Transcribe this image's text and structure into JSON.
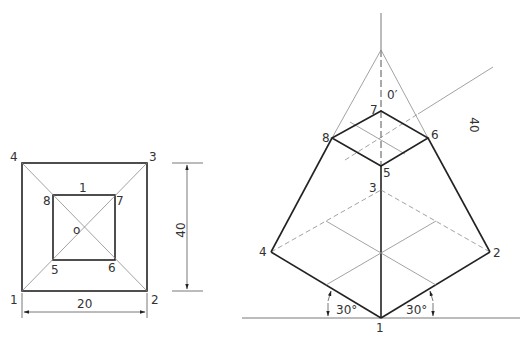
{
  "plan_view": {
    "corner_labels": [
      "1",
      "2",
      "3",
      "4"
    ],
    "inner_labels": [
      "5",
      "6",
      "7",
      "8"
    ],
    "top_face_label": "1",
    "center_label": "o",
    "width_dimension": "20",
    "height_dimension": "40"
  },
  "isometric_view": {
    "base_labels": [
      "1",
      "2",
      "3",
      "4"
    ],
    "top_labels": [
      "5",
      "6",
      "7",
      "8"
    ],
    "apex_label": "0′",
    "height_dimension": "40",
    "angle_left": "30°",
    "angle_right": "30°"
  },
  "colors": {
    "line": "#222222",
    "construction": "#8a8a8a",
    "text": "#333333"
  }
}
